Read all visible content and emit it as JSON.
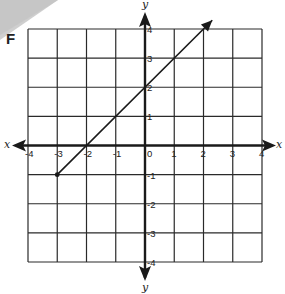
{
  "panel_label": "F",
  "chart_data": {
    "type": "line",
    "title": "F",
    "xlabel": "x",
    "ylabel": "y",
    "xlim": [
      -4,
      4
    ],
    "ylim": [
      -4,
      4
    ],
    "grid": true,
    "x_ticks": [
      -4,
      -3,
      -2,
      -1,
      0,
      1,
      2,
      3,
      4
    ],
    "y_ticks": [
      -4,
      -3,
      -2,
      -1,
      1,
      2,
      3,
      4
    ],
    "x_tick_labels": [
      "-4",
      "-3",
      "-2",
      "-1",
      "0",
      "1",
      "2",
      "3",
      "4"
    ],
    "y_tick_labels": [
      "-4",
      "-3",
      "-2",
      "-1",
      "1",
      "2",
      "3",
      "4"
    ],
    "series": [
      {
        "name": "line",
        "equation": "y = x + 2",
        "slope": 1,
        "intercept": 2,
        "start": {
          "x": -3,
          "y": -1,
          "endpoint": "closed"
        },
        "end": {
          "x": 2.3,
          "y": 4.3,
          "endpoint": "arrow"
        },
        "points": [
          {
            "x": -3,
            "y": -1
          },
          {
            "x": -2,
            "y": 0
          },
          {
            "x": -1,
            "y": 1
          },
          {
            "x": 0,
            "y": 2
          },
          {
            "x": 1,
            "y": 3
          },
          {
            "x": 2,
            "y": 4
          }
        ]
      }
    ]
  },
  "colors": {
    "ink": "#1a1a1a",
    "shade": "#c8c8c8",
    "background": "#ffffff"
  }
}
